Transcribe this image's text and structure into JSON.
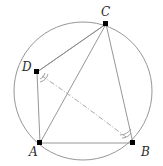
{
  "figure": {
    "kind": "cyclic-quadrilateral-diagram",
    "width": 163,
    "height": 166,
    "background": "#ffffff",
    "stroke_color": "#8a8a8a",
    "point_color": "#000000",
    "label_color": "#2b2b2b"
  },
  "circle": {
    "name": "circumcircle",
    "cx": 83,
    "cy": 91,
    "r": 69,
    "stroke": "#8a8a8a",
    "stroke_width": 0.9,
    "fill": "none"
  },
  "points": [
    {
      "id": "A",
      "label": "A",
      "x": 40,
      "y": 143,
      "label_x": 29,
      "label_y": 146
    },
    {
      "id": "B",
      "label": "B",
      "x": 133,
      "y": 143,
      "label_x": 141,
      "label_y": 146
    },
    {
      "id": "C",
      "label": "C",
      "x": 106,
      "y": 24,
      "label_x": 101,
      "label_y": 6
    },
    {
      "id": "D",
      "label": "D",
      "x": 37,
      "y": 72,
      "label_x": 22,
      "label_y": 61
    }
  ],
  "segments": [
    {
      "id": "AB",
      "from": "A",
      "to": "B",
      "style": "solid"
    },
    {
      "id": "AD",
      "from": "A",
      "to": "D",
      "style": "solid"
    },
    {
      "id": "DC",
      "from": "D",
      "to": "C",
      "style": "solid"
    },
    {
      "id": "CB",
      "from": "C",
      "to": "B",
      "style": "solid"
    },
    {
      "id": "AC",
      "from": "A",
      "to": "C",
      "style": "solid"
    },
    {
      "id": "CB2",
      "from": "C",
      "to": "B",
      "style": "solid"
    }
  ],
  "dashdot_arc": {
    "id": "DB-arc",
    "from": "D",
    "to": "B",
    "style": "dash-dot",
    "description": "curved dash-dotted arc from D to B"
  },
  "angle_marks": [
    {
      "id": "angle-D",
      "at": "D",
      "arcs": 2,
      "style": "solid"
    },
    {
      "id": "angle-B",
      "at": "B",
      "arcs": 2,
      "style": "solid"
    }
  ]
}
